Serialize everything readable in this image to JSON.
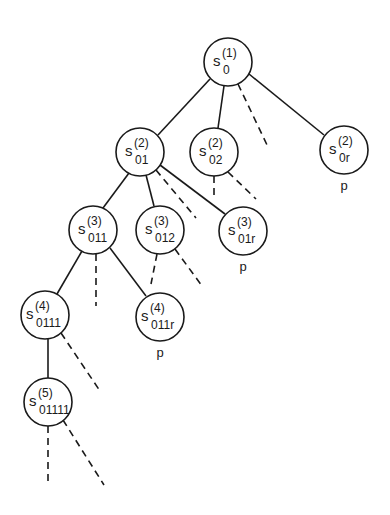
{
  "diagram": {
    "type": "tree",
    "colors": {
      "stroke": "#1a1a1a",
      "background": "#ffffff"
    },
    "nodes": [
      {
        "id": "n0",
        "symbol": "s",
        "sup": "(1)",
        "sub": "0",
        "cx": 228,
        "cy": 62,
        "r": 24,
        "mark": ""
      },
      {
        "id": "n01",
        "symbol": "s",
        "sup": "(2)",
        "sub": "01",
        "cx": 140,
        "cy": 152,
        "r": 24,
        "mark": ""
      },
      {
        "id": "n02",
        "symbol": "s",
        "sup": "(2)",
        "sub": "02",
        "cx": 214,
        "cy": 152,
        "r": 24,
        "mark": ""
      },
      {
        "id": "n0r",
        "symbol": "s",
        "sup": "(2)",
        "sub": "0r",
        "cx": 344,
        "cy": 150,
        "r": 24,
        "mark": "p"
      },
      {
        "id": "n011",
        "symbol": "s",
        "sup": "(3)",
        "sub": "011",
        "cx": 93,
        "cy": 230,
        "r": 24,
        "mark": ""
      },
      {
        "id": "n012",
        "symbol": "s",
        "sup": "(3)",
        "sub": "012",
        "cx": 160,
        "cy": 230,
        "r": 24,
        "mark": ""
      },
      {
        "id": "n01r",
        "symbol": "s",
        "sup": "(3)",
        "sub": "01r",
        "cx": 243,
        "cy": 231,
        "r": 24,
        "mark": "p"
      },
      {
        "id": "n0111",
        "symbol": "s",
        "sup": "(4)",
        "sub": "0111",
        "cx": 45,
        "cy": 315,
        "r": 24,
        "mark": ""
      },
      {
        "id": "n011r",
        "symbol": "s",
        "sup": "(4)",
        "sub": "011r",
        "cx": 160,
        "cy": 317,
        "r": 24,
        "mark": "p"
      },
      {
        "id": "n01111",
        "symbol": "s",
        "sup": "(5)",
        "sub": "01111",
        "cx": 48,
        "cy": 402,
        "r": 24,
        "mark": ""
      }
    ],
    "edges": [
      {
        "x1": 210,
        "y1": 79,
        "x2": 158,
        "y2": 135,
        "style": "solid"
      },
      {
        "x1": 224,
        "y1": 86,
        "x2": 218,
        "y2": 128,
        "style": "solid"
      },
      {
        "x1": 238,
        "y1": 84,
        "x2": 268,
        "y2": 147,
        "style": "dashed"
      },
      {
        "x1": 249,
        "y1": 74,
        "x2": 324,
        "y2": 135,
        "style": "solid"
      },
      {
        "x1": 214,
        "y1": 176,
        "x2": 214,
        "y2": 195,
        "style": "dashed"
      },
      {
        "x1": 228,
        "y1": 172,
        "x2": 256,
        "y2": 199,
        "style": "dashed"
      },
      {
        "x1": 129,
        "y1": 173,
        "x2": 103,
        "y2": 208,
        "style": "solid"
      },
      {
        "x1": 146,
        "y1": 175,
        "x2": 154,
        "y2": 206,
        "style": "solid"
      },
      {
        "x1": 156,
        "y1": 170,
        "x2": 196,
        "y2": 218,
        "style": "dashed"
      },
      {
        "x1": 160,
        "y1": 165,
        "x2": 225,
        "y2": 214,
        "style": "solid"
      },
      {
        "x1": 82,
        "y1": 251,
        "x2": 57,
        "y2": 294,
        "style": "solid"
      },
      {
        "x1": 96,
        "y1": 254,
        "x2": 96,
        "y2": 306,
        "style": "dashed"
      },
      {
        "x1": 110,
        "y1": 248,
        "x2": 146,
        "y2": 296,
        "style": "solid"
      },
      {
        "x1": 157,
        "y1": 254,
        "x2": 151,
        "y2": 284,
        "style": "dashed"
      },
      {
        "x1": 175,
        "y1": 249,
        "x2": 202,
        "y2": 286,
        "style": "dashed"
      },
      {
        "x1": 48,
        "y1": 339,
        "x2": 48,
        "y2": 378,
        "style": "solid"
      },
      {
        "x1": 61,
        "y1": 333,
        "x2": 100,
        "y2": 391,
        "style": "dashed"
      },
      {
        "x1": 48,
        "y1": 426,
        "x2": 48,
        "y2": 485,
        "style": "dashed"
      },
      {
        "x1": 63,
        "y1": 420,
        "x2": 104,
        "y2": 485,
        "style": "dashed"
      }
    ]
  }
}
